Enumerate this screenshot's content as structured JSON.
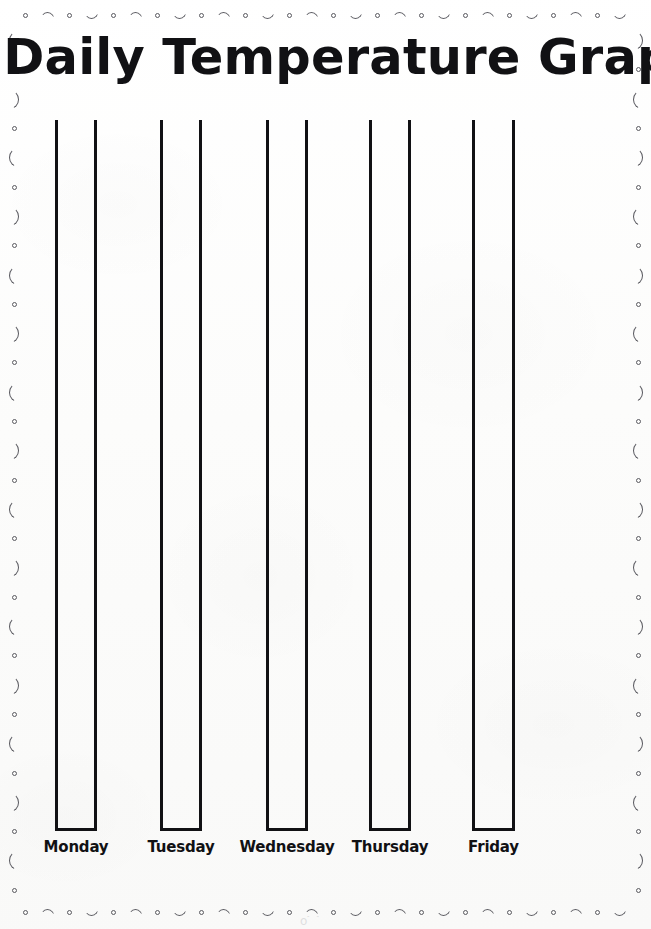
{
  "worksheet": {
    "title": "Daily Temperature Graph",
    "page_background": "#fbfbfa",
    "ink_color": "#111114",
    "border_ink_color": "#54545a",
    "scan_artifact_text": "o⌒"
  },
  "border": {
    "name": "decorative-doodle-border",
    "horizontal_sequence": [
      "circle",
      "arc-up",
      "circle",
      "arc-down"
    ],
    "vertical_sequence": [
      "paren-left",
      "circle",
      "paren-right",
      "circle"
    ],
    "horizontal_count": 28,
    "vertical_count": 30
  },
  "chart_data": {
    "type": "bar",
    "title": "Daily Temperature Graph",
    "xlabel": "",
    "ylabel": "",
    "orientation": "vertical",
    "blank_worksheet": true,
    "grid": false,
    "legend": null,
    "categories": [
      "Monday",
      "Tuesday",
      "Wednesday",
      "Thursday",
      "Friday"
    ],
    "values": [
      0,
      0,
      0,
      0,
      0
    ],
    "ylim": [
      0,
      100
    ],
    "bars": [
      {
        "label": "Monday",
        "value": 0,
        "left": 55,
        "width": 42
      },
      {
        "label": "Tuesday",
        "value": 0,
        "left": 160,
        "width": 42
      },
      {
        "label": "Wednesday",
        "value": 0,
        "left": 266,
        "width": 42
      },
      {
        "label": "Thursday",
        "value": 0,
        "left": 369,
        "width": 42
      },
      {
        "label": "Friday",
        "value": 0,
        "left": 472,
        "width": 43
      }
    ],
    "bar_top_y": 120,
    "bar_baseline_y": 831,
    "bar_height": 711,
    "label_y": 838
  }
}
